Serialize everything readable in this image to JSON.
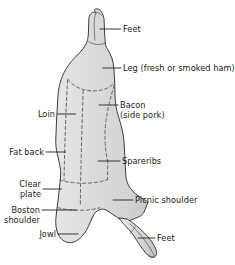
{
  "diagram": {
    "colors": {
      "body_fill": "#d9d9d9",
      "body_fill_light": "#e4e4e4",
      "outline": "#3d3d3d",
      "dashed_cut": "#595959",
      "leader_line": "#2b2b2b",
      "text": "#1a1a1a",
      "background": "#ffffff"
    },
    "labels": [
      {
        "id": "feet-top",
        "name": "feet",
        "lines": [
          "Feet"
        ],
        "side": "right"
      },
      {
        "id": "leg-ham",
        "name": "leg",
        "lines": [
          "Leg (fresh or smoked ham)"
        ],
        "side": "right"
      },
      {
        "id": "bacon",
        "name": "bacon",
        "lines": [
          "Bacon",
          "(side pork)"
        ],
        "side": "right"
      },
      {
        "id": "spareribs",
        "name": "spareribs",
        "lines": [
          "Spareribs"
        ],
        "side": "right"
      },
      {
        "id": "picnic-shoulder",
        "name": "picnic-shoulder",
        "lines": [
          "Picnic shoulder"
        ],
        "side": "right"
      },
      {
        "id": "feet-bottom",
        "name": "feet",
        "lines": [
          "Feet"
        ],
        "side": "right"
      },
      {
        "id": "loin",
        "name": "loin",
        "lines": [
          "Loin"
        ],
        "side": "left"
      },
      {
        "id": "fat-back",
        "name": "fat-back",
        "lines": [
          "Fat back"
        ],
        "side": "left"
      },
      {
        "id": "clear-plate",
        "name": "clear-plate",
        "lines": [
          "Clear",
          "plate"
        ],
        "side": "left"
      },
      {
        "id": "boston-shoulder",
        "name": "boston-shoulder",
        "lines": [
          "Boston",
          "shoulder"
        ],
        "side": "left"
      },
      {
        "id": "jowl",
        "name": "jowl",
        "lines": [
          "Jowl"
        ],
        "side": "left"
      }
    ],
    "label_text": {
      "feet_top": "Feet",
      "leg": "Leg (fresh or smoked ham)",
      "bacon_line1": "Bacon",
      "bacon_line2": "(side pork)",
      "spareribs": "Spareribs",
      "picnic_shoulder": "Picnic shoulder",
      "feet_bottom": "Feet",
      "loin": "Loin",
      "fat_back": "Fat back",
      "clear_plate_line1": "Clear",
      "clear_plate_line2": "plate",
      "boston_shoulder_line1": "Boston",
      "boston_shoulder_line2": "shoulder",
      "jowl": "Jowl"
    }
  }
}
